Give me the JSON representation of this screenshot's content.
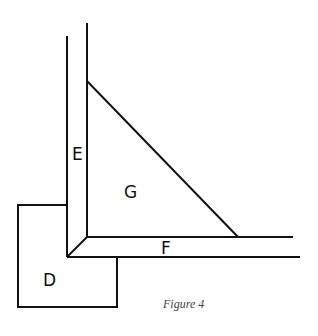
{
  "figure": {
    "caption": "Figure 4",
    "labels": {
      "D": "D",
      "E": "E",
      "F": "F",
      "G": "G"
    },
    "stroke_color": "#111111"
  }
}
